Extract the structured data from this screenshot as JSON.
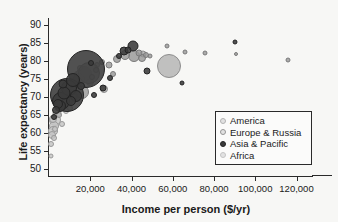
{
  "chart_data": {
    "type": "scatter",
    "title": "",
    "xlabel": "Income per person ($/yr)",
    "ylabel": "Life expectancy (years)",
    "xlim": [
      0,
      128000
    ],
    "ylim": [
      48,
      92
    ],
    "xticks": [
      "20,000",
      "40,000",
      "60,000",
      "80,000",
      "100,000",
      "120,000"
    ],
    "xtick_values": [
      20000,
      40000,
      60000,
      80000,
      100000,
      120000
    ],
    "yticks": [
      "50",
      "55",
      "60",
      "65",
      "70",
      "75",
      "80",
      "85",
      "90"
    ],
    "ytick_values": [
      50,
      55,
      60,
      65,
      70,
      75,
      80,
      85,
      90
    ],
    "grid": false,
    "legend_position": "lower-right",
    "size_encoding": "population",
    "legend": [
      {
        "label": "America",
        "marker": "open-circle",
        "color": "#b2b2b2"
      },
      {
        "label": "Europe & Russia",
        "marker": "open-circle",
        "color": "#969696"
      },
      {
        "label": "Asia & Pacific",
        "marker": "filled-circle",
        "color": "#3a3a3a"
      },
      {
        "label": "Africa",
        "marker": "open-circle",
        "color": "#c4c4c4"
      }
    ],
    "series": [
      {
        "name": "Asia & Pacific",
        "color": "#3a3a3a",
        "points": [
          {
            "x": 18000,
            "y": 77.8,
            "r": 19
          },
          {
            "x": 8500,
            "y": 70.5,
            "r": 17
          },
          {
            "x": 6000,
            "y": 69.0,
            "r": 9
          },
          {
            "x": 9800,
            "y": 72.5,
            "r": 8
          },
          {
            "x": 11500,
            "y": 74.8,
            "r": 7
          },
          {
            "x": 7200,
            "y": 71.0,
            "r": 6.5
          },
          {
            "x": 5200,
            "y": 67.5,
            "r": 6
          },
          {
            "x": 13000,
            "y": 70.2,
            "r": 6
          },
          {
            "x": 4200,
            "y": 68.0,
            "r": 5
          },
          {
            "x": 10500,
            "y": 68.8,
            "r": 5
          },
          {
            "x": 6800,
            "y": 73.5,
            "r": 4.5
          },
          {
            "x": 3600,
            "y": 66.5,
            "r": 4
          },
          {
            "x": 15500,
            "y": 73.0,
            "r": 4
          },
          {
            "x": 40500,
            "y": 84.2,
            "r": 5.5
          },
          {
            "x": 36500,
            "y": 82.8,
            "r": 4.5
          },
          {
            "x": 38500,
            "y": 83.0,
            "r": 3.5
          },
          {
            "x": 34000,
            "y": 81.5,
            "r": 3
          },
          {
            "x": 47500,
            "y": 77.3,
            "r": 3.5
          },
          {
            "x": 29500,
            "y": 75.2,
            "r": 3
          },
          {
            "x": 26000,
            "y": 72.5,
            "r": 3.5
          },
          {
            "x": 22000,
            "y": 70.5,
            "r": 3
          },
          {
            "x": 64500,
            "y": 73.8,
            "r": 2.5
          },
          {
            "x": 90000,
            "y": 85.2,
            "r": 2.5
          },
          {
            "x": 2600,
            "y": 64.5,
            "r": 3
          },
          {
            "x": 20500,
            "y": 79.5,
            "r": 3
          }
        ]
      },
      {
        "name": "Europe & Russia",
        "color": "#969696",
        "points": [
          {
            "x": 19500,
            "y": 76.8,
            "r": 11
          },
          {
            "x": 16000,
            "y": 71.5,
            "r": 7
          },
          {
            "x": 41000,
            "y": 81.5,
            "r": 6
          },
          {
            "x": 37000,
            "y": 81.8,
            "r": 5
          },
          {
            "x": 45000,
            "y": 81.0,
            "r": 4
          },
          {
            "x": 33000,
            "y": 80.5,
            "r": 4
          },
          {
            "x": 43500,
            "y": 82.2,
            "r": 3.5
          },
          {
            "x": 47000,
            "y": 81.8,
            "r": 3
          },
          {
            "x": 29000,
            "y": 79.0,
            "r": 3.5
          },
          {
            "x": 25500,
            "y": 79.8,
            "r": 3
          },
          {
            "x": 23000,
            "y": 77.5,
            "r": 3
          },
          {
            "x": 21000,
            "y": 75.5,
            "r": 3
          },
          {
            "x": 49000,
            "y": 81.5,
            "r": 2.5
          },
          {
            "x": 57000,
            "y": 84.2,
            "r": 2.5
          },
          {
            "x": 66000,
            "y": 82.5,
            "r": 2.5
          },
          {
            "x": 75500,
            "y": 82.3,
            "r": 2.5
          },
          {
            "x": 90500,
            "y": 82.0,
            "r": 2
          },
          {
            "x": 116000,
            "y": 80.3,
            "r": 2.5
          },
          {
            "x": 31000,
            "y": 76.5,
            "r": 3
          },
          {
            "x": 14000,
            "y": 73.5,
            "r": 4
          },
          {
            "x": 12000,
            "y": 70.0,
            "r": 4
          }
        ]
      },
      {
        "name": "America",
        "color": "#b2b2b2",
        "points": [
          {
            "x": 58000,
            "y": 78.5,
            "r": 12
          },
          {
            "x": 17000,
            "y": 76.5,
            "r": 8
          },
          {
            "x": 14500,
            "y": 75.0,
            "r": 6
          },
          {
            "x": 9000,
            "y": 69.5,
            "r": 6
          },
          {
            "x": 11000,
            "y": 73.8,
            "r": 5
          },
          {
            "x": 20000,
            "y": 74.2,
            "r": 4
          },
          {
            "x": 26500,
            "y": 72.2,
            "r": 4
          },
          {
            "x": 7500,
            "y": 72.0,
            "r": 4
          },
          {
            "x": 6200,
            "y": 70.8,
            "r": 3.5
          },
          {
            "x": 45500,
            "y": 82.0,
            "r": 3.5
          },
          {
            "x": 15000,
            "y": 78.0,
            "r": 3
          },
          {
            "x": 10000,
            "y": 66.8,
            "r": 3
          },
          {
            "x": 5000,
            "y": 65.0,
            "r": 3
          },
          {
            "x": 23500,
            "y": 79.0,
            "r": 3
          }
        ]
      },
      {
        "name": "Africa",
        "color": "#c4c4c4",
        "points": [
          {
            "x": 3000,
            "y": 63.5,
            "r": 6
          },
          {
            "x": 2400,
            "y": 62.0,
            "r": 5
          },
          {
            "x": 1800,
            "y": 60.5,
            "r": 5
          },
          {
            "x": 1500,
            "y": 59.5,
            "r": 4
          },
          {
            "x": 3800,
            "y": 65.5,
            "r": 4.5
          },
          {
            "x": 2000,
            "y": 64.0,
            "r": 4
          },
          {
            "x": 1200,
            "y": 57.0,
            "r": 3
          },
          {
            "x": 1000,
            "y": 53.5,
            "r": 2.5
          },
          {
            "x": 4500,
            "y": 66.5,
            "r": 3.5
          },
          {
            "x": 5500,
            "y": 68.5,
            "r": 3
          },
          {
            "x": 2800,
            "y": 61.0,
            "r": 3
          },
          {
            "x": 6500,
            "y": 62.5,
            "r": 3
          },
          {
            "x": 8000,
            "y": 66.0,
            "r": 3
          },
          {
            "x": 13500,
            "y": 76.5,
            "r": 3
          },
          {
            "x": 9500,
            "y": 71.5,
            "r": 3
          },
          {
            "x": 2200,
            "y": 58.5,
            "r": 3
          }
        ]
      }
    ]
  }
}
